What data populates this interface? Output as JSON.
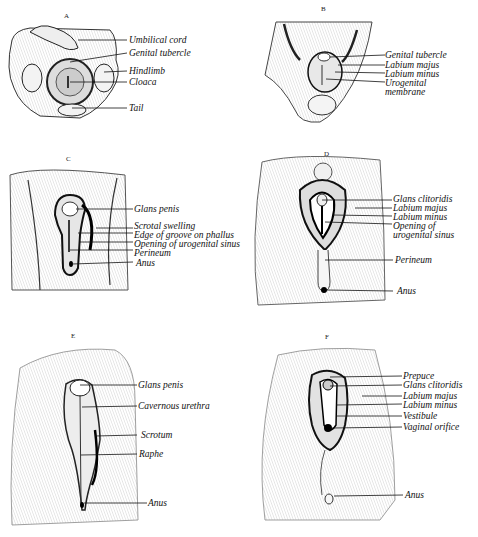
{
  "figure": {
    "panels": [
      {
        "id": "A",
        "letter": "A",
        "labels": [
          "Umbilical cord",
          "Genital tubercle",
          "Hindlimb",
          "Cloaca",
          "Tail"
        ]
      },
      {
        "id": "B",
        "letter": "B",
        "labels": [
          "Genital tubercle",
          "Labium majus",
          "Labium minus",
          "Urogenital",
          "membrane"
        ]
      },
      {
        "id": "C",
        "letter": "C",
        "labels": [
          "Glans penis",
          "Scrotal swelling",
          "Edge of groove on phallus",
          "Opening of urogenital sinus",
          "Perineum",
          "Anus"
        ]
      },
      {
        "id": "D",
        "letter": "D",
        "labels": [
          "Glans clitoridis",
          "Labium majus",
          "Labium minus",
          "Opening of",
          "urogenital sinus",
          "Perineum",
          "Anus"
        ]
      },
      {
        "id": "E",
        "letter": "E",
        "labels": [
          "Glans penis",
          "Cavernous urethra",
          "Scrotum",
          "Raphe",
          "Anus"
        ]
      },
      {
        "id": "F",
        "letter": "F",
        "labels": [
          "Prepuce",
          "Glans clitoridis",
          "Labium majus",
          "Labium minus",
          "Vestibule",
          "Vaginal orifice",
          "Anus"
        ]
      }
    ]
  }
}
